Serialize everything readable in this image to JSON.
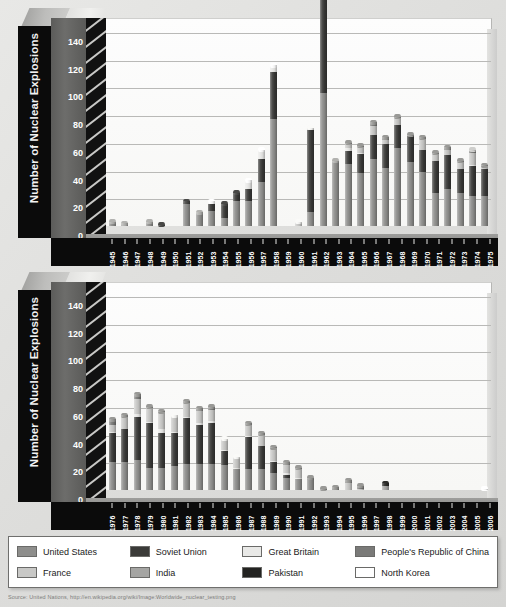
{
  "legend": {
    "items": [
      {
        "label": "United States",
        "color": "#8e8e8c"
      },
      {
        "label": "Soviet Union",
        "color": "#3a3a38"
      },
      {
        "label": "Great Britain",
        "color": "#e9e9e7"
      },
      {
        "label": "People's Republic of China",
        "color": "#7a7a78"
      },
      {
        "label": "France",
        "color": "#c8c8c6"
      },
      {
        "label": "India",
        "color": "#a5a5a3"
      },
      {
        "label": "Pakistan",
        "color": "#232321"
      },
      {
        "label": "North Korea",
        "color": "#ffffff"
      }
    ]
  },
  "source_note": "Source: United Nations, http://en.wikipedia.org/wiki/Image:Worldwide_nuclear_testing.png",
  "chart_data": [
    {
      "type": "bar",
      "title": "",
      "stacked": true,
      "xlabel": "",
      "ylabel": "Number of Nuclear Explosions",
      "ylim": [
        0,
        150
      ],
      "yticks": [
        0,
        20,
        40,
        60,
        80,
        100,
        120,
        140
      ],
      "grid": true,
      "legend_position": "bottom",
      "categories": [
        "1945",
        "1946",
        "1947",
        "1948",
        "1949",
        "1950",
        "1951",
        "1952",
        "1953",
        "1954",
        "1955",
        "1956",
        "1957",
        "1958",
        "1959",
        "1960",
        "1961",
        "1962",
        "1963",
        "1964",
        "1965",
        "1966",
        "1967",
        "1968",
        "1969",
        "1970",
        "1971",
        "1972",
        "1973",
        "1974",
        "1975"
      ],
      "series": [
        {
          "name": "United States",
          "values": [
            3,
            2,
            0,
            3,
            0,
            0,
            16,
            10,
            11,
            6,
            18,
            18,
            32,
            77,
            0,
            0,
            10,
            96,
            47,
            45,
            38,
            48,
            42,
            56,
            46,
            39,
            24,
            27,
            24,
            22,
            22
          ]
        },
        {
          "name": "Soviet Union",
          "values": [
            0,
            0,
            0,
            0,
            1,
            0,
            2,
            0,
            5,
            10,
            6,
            9,
            16,
            34,
            0,
            0,
            59,
            79,
            0,
            9,
            14,
            18,
            17,
            17,
            19,
            16,
            23,
            24,
            17,
            21,
            19
          ]
        },
        {
          "name": "Great Britain",
          "values": [
            0,
            0,
            0,
            0,
            0,
            0,
            0,
            0,
            2,
            0,
            0,
            6,
            7,
            5,
            0,
            0,
            0,
            2,
            0,
            2,
            1,
            0,
            0,
            0,
            0,
            0,
            0,
            0,
            0,
            1,
            0
          ]
        },
        {
          "name": "France",
          "values": [
            0,
            0,
            0,
            0,
            0,
            0,
            0,
            0,
            0,
            0,
            0,
            0,
            0,
            0,
            0,
            3,
            2,
            1,
            0,
            3,
            4,
            6,
            3,
            5,
            0,
            8,
            5,
            4,
            5,
            9,
            2
          ]
        },
        {
          "name": "People's Republic of China",
          "values": [
            0,
            0,
            0,
            0,
            0,
            0,
            0,
            0,
            0,
            0,
            0,
            0,
            0,
            0,
            0,
            0,
            0,
            0,
            0,
            1,
            1,
            3,
            2,
            1,
            1,
            1,
            1,
            2,
            1,
            1,
            1
          ]
        },
        {
          "name": "India",
          "values": [
            0,
            0,
            0,
            0,
            0,
            0,
            0,
            0,
            0,
            0,
            0,
            0,
            0,
            0,
            0,
            0,
            0,
            0,
            0,
            0,
            0,
            0,
            0,
            0,
            0,
            0,
            0,
            0,
            0,
            1,
            0
          ]
        },
        {
          "name": "Pakistan",
          "values": [
            0,
            0,
            0,
            0,
            0,
            0,
            0,
            0,
            0,
            0,
            0,
            0,
            0,
            0,
            0,
            0,
            0,
            0,
            0,
            0,
            0,
            0,
            0,
            0,
            0,
            0,
            0,
            0,
            0,
            0,
            0
          ]
        },
        {
          "name": "North Korea",
          "values": [
            0,
            0,
            0,
            0,
            0,
            0,
            0,
            0,
            0,
            0,
            0,
            0,
            0,
            0,
            0,
            0,
            0,
            0,
            0,
            0,
            0,
            0,
            0,
            0,
            0,
            0,
            0,
            0,
            0,
            0,
            0
          ]
        }
      ]
    },
    {
      "type": "bar",
      "title": "",
      "stacked": true,
      "xlabel": "",
      "ylabel": "Number of Nuclear Explosions",
      "ylim": [
        0,
        150
      ],
      "yticks": [
        0,
        20,
        40,
        60,
        80,
        100,
        120,
        140
      ],
      "grid": true,
      "legend_position": "bottom",
      "categories": [
        "1976",
        "1977",
        "1978",
        "1979",
        "1980",
        "1981",
        "1982",
        "1983",
        "1984",
        "1985",
        "1986",
        "1987",
        "1988",
        "1989",
        "1990",
        "1991",
        "1992",
        "1993",
        "1994",
        "1995",
        "1996",
        "1997",
        "1998",
        "1999",
        "2000",
        "2001",
        "2002",
        "2003",
        "2004",
        "2005",
        "2006"
      ],
      "series": [
        {
          "name": "United States",
          "values": [
            20,
            20,
            22,
            16,
            16,
            17,
            19,
            19,
            19,
            18,
            15,
            15,
            15,
            12,
            9,
            8,
            7,
            0,
            0,
            0,
            0,
            0,
            0,
            0,
            0,
            0,
            0,
            0,
            0,
            0,
            0
          ]
        },
        {
          "name": "Soviet Union",
          "values": [
            21,
            24,
            31,
            32,
            25,
            24,
            33,
            28,
            29,
            10,
            0,
            23,
            17,
            8,
            2,
            0,
            0,
            0,
            0,
            0,
            0,
            0,
            0,
            0,
            0,
            0,
            0,
            0,
            0,
            0,
            0
          ]
        },
        {
          "name": "Great Britain",
          "values": [
            1,
            0,
            2,
            1,
            3,
            1,
            1,
            1,
            2,
            1,
            1,
            1,
            0,
            1,
            1,
            1,
            0,
            0,
            0,
            0,
            0,
            0,
            0,
            0,
            0,
            0,
            0,
            0,
            0,
            0,
            0
          ]
        },
        {
          "name": "France",
          "values": [
            5,
            9,
            11,
            10,
            12,
            12,
            10,
            9,
            8,
            8,
            8,
            8,
            8,
            9,
            6,
            6,
            0,
            0,
            0,
            5,
            1,
            0,
            0,
            0,
            0,
            0,
            0,
            0,
            0,
            0,
            0
          ]
        },
        {
          "name": "People's Republic of China",
          "values": [
            4,
            1,
            3,
            1,
            1,
            0,
            1,
            2,
            2,
            0,
            0,
            1,
            1,
            1,
            2,
            1,
            2,
            1,
            2,
            2,
            2,
            0,
            0,
            0,
            0,
            0,
            0,
            0,
            0,
            0,
            0
          ]
        },
        {
          "name": "India",
          "values": [
            0,
            0,
            0,
            0,
            0,
            0,
            0,
            0,
            0,
            0,
            0,
            0,
            0,
            0,
            0,
            0,
            0,
            0,
            0,
            0,
            0,
            0,
            3,
            0,
            0,
            0,
            0,
            0,
            0,
            0,
            0
          ]
        },
        {
          "name": "Pakistan",
          "values": [
            0,
            0,
            0,
            0,
            0,
            0,
            0,
            0,
            0,
            0,
            0,
            0,
            0,
            0,
            0,
            0,
            0,
            0,
            0,
            0,
            0,
            0,
            2,
            0,
            0,
            0,
            0,
            0,
            0,
            0,
            0
          ]
        },
        {
          "name": "North Korea",
          "values": [
            0,
            0,
            0,
            0,
            0,
            0,
            0,
            0,
            0,
            0,
            0,
            0,
            0,
            0,
            0,
            0,
            0,
            0,
            0,
            0,
            0,
            0,
            0,
            0,
            0,
            0,
            0,
            0,
            0,
            0,
            1
          ]
        }
      ]
    }
  ]
}
